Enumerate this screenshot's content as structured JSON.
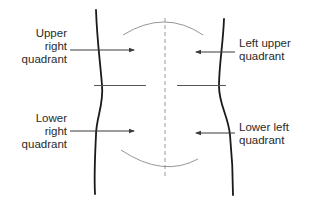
{
  "diagram": {
    "labels": {
      "upper_right": [
        "Upper",
        "right",
        "quadrant"
      ],
      "lower_right": [
        "Lower",
        "right",
        "quadrant"
      ],
      "left_upper": [
        "Left upper",
        "quadrant"
      ],
      "lower_left": [
        "Lower left",
        "quadrant"
      ]
    },
    "colors": {
      "outline": "#1a1a1a",
      "arrow": "#3a3a3a",
      "divider": "#555555",
      "midline_dashed": "#9a9a9a",
      "arc": "#8a8a8a",
      "text": "#2a2a2a",
      "background": "#ffffff"
    }
  }
}
